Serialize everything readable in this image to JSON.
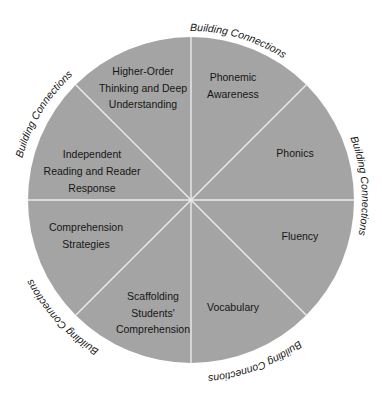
{
  "diagram": {
    "type": "circular-wheel",
    "segment_color": "#a4a4a4",
    "divider_color": "#ececec",
    "text_color": "#161616",
    "segments": [
      {
        "lines": [
          "Phonemic",
          "Awareness"
        ]
      },
      {
        "lines": [
          "Phonics"
        ]
      },
      {
        "lines": [
          "Fluency"
        ]
      },
      {
        "lines": [
          "Vocabulary"
        ]
      },
      {
        "lines": [
          "Scaffolding",
          "Students'",
          "Comprehension"
        ]
      },
      {
        "lines": [
          "Comprehension",
          "Strategies"
        ]
      },
      {
        "lines": [
          "Independent",
          "Reading and Reader",
          "Response"
        ]
      },
      {
        "lines": [
          "Higher-Order",
          "Thinking and Deep",
          "Understanding"
        ]
      }
    ],
    "arc_labels": [
      "Building Connections",
      "Building Connections",
      "Building Connections",
      "Building Connections",
      "Building Connections"
    ]
  }
}
